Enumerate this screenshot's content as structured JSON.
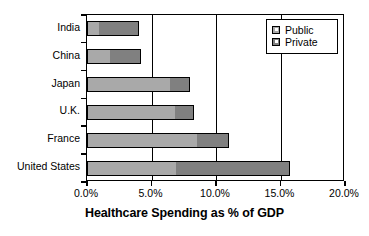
{
  "chart_data": {
    "type": "bar",
    "orientation": "horizontal",
    "stacked": true,
    "title": "",
    "xlabel": "Healthcare Spending as % of GDP",
    "ylabel": "",
    "xlim": [
      0,
      20
    ],
    "xticks": [
      0,
      5,
      10,
      15,
      20
    ],
    "xtick_labels": [
      "0.0%",
      "5.0%",
      "10.0%",
      "15.0%",
      "20.0%"
    ],
    "grid": true,
    "grid_axis": "x",
    "legend_position": "top-right",
    "categories": [
      "India",
      "China",
      "Japan",
      "U.K.",
      "France",
      "United States"
    ],
    "series": [
      {
        "name": "Public",
        "color": "#a9a9a9",
        "values": [
          0.9,
          1.8,
          6.4,
          6.8,
          8.5,
          6.9
        ]
      },
      {
        "name": "Private",
        "color": "#808080",
        "values": [
          3.1,
          2.4,
          1.6,
          1.5,
          2.5,
          8.8
        ]
      }
    ],
    "totals": [
      4.0,
      4.2,
      8.0,
      8.3,
      11.0,
      15.7
    ]
  },
  "legend": {
    "items": [
      {
        "label": "Public",
        "swatch": "public-swatch-icon"
      },
      {
        "label": "Private",
        "swatch": "private-swatch-icon"
      }
    ]
  }
}
